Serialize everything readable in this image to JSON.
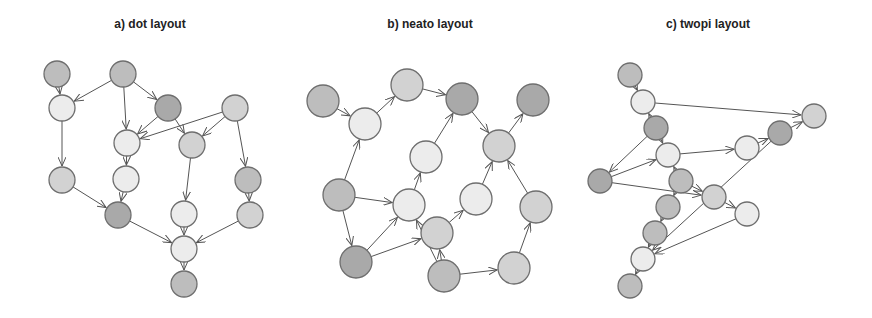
{
  "panels": [
    {
      "title": "a) dot layout",
      "title_x": 150,
      "radius": 13,
      "nodes": [
        {
          "id": "a1",
          "x": 57,
          "y": 74,
          "shade": "dark"
        },
        {
          "id": "a2",
          "x": 123,
          "y": 74,
          "shade": "dark"
        },
        {
          "id": "a3",
          "x": 62,
          "y": 108,
          "shade": "light"
        },
        {
          "id": "a4",
          "x": 168,
          "y": 108,
          "shade": "darker"
        },
        {
          "id": "a5",
          "x": 235,
          "y": 108,
          "shade": "mid"
        },
        {
          "id": "a6",
          "x": 127,
          "y": 143,
          "shade": "light"
        },
        {
          "id": "a7",
          "x": 192,
          "y": 145,
          "shade": "mid"
        },
        {
          "id": "a8",
          "x": 62,
          "y": 180,
          "shade": "mid"
        },
        {
          "id": "a9",
          "x": 126,
          "y": 179,
          "shade": "light"
        },
        {
          "id": "a10",
          "x": 248,
          "y": 180,
          "shade": "dark"
        },
        {
          "id": "a11",
          "x": 118,
          "y": 215,
          "shade": "darker"
        },
        {
          "id": "a12",
          "x": 184,
          "y": 214,
          "shade": "light"
        },
        {
          "id": "a13",
          "x": 250,
          "y": 215,
          "shade": "mid"
        },
        {
          "id": "a14",
          "x": 184,
          "y": 249,
          "shade": "light"
        },
        {
          "id": "a15",
          "x": 184,
          "y": 284,
          "shade": "dark"
        }
      ],
      "edges": [
        [
          "a1",
          "a3"
        ],
        [
          "a2",
          "a3"
        ],
        [
          "a2",
          "a6"
        ],
        [
          "a2",
          "a4"
        ],
        [
          "a4",
          "a6"
        ],
        [
          "a4",
          "a7"
        ],
        [
          "a5",
          "a6"
        ],
        [
          "a5",
          "a7"
        ],
        [
          "a5",
          "a10"
        ],
        [
          "a3",
          "a8"
        ],
        [
          "a6",
          "a9"
        ],
        [
          "a8",
          "a11"
        ],
        [
          "a9",
          "a11"
        ],
        [
          "a7",
          "a12"
        ],
        [
          "a10",
          "a13"
        ],
        [
          "a11",
          "a14"
        ],
        [
          "a12",
          "a14"
        ],
        [
          "a13",
          "a14"
        ],
        [
          "a14",
          "a15"
        ]
      ]
    },
    {
      "title": "b) neato layout",
      "title_x": 430,
      "radius": 16,
      "nodes": [
        {
          "id": "b1",
          "x": 323,
          "y": 101,
          "shade": "dark"
        },
        {
          "id": "b2",
          "x": 365,
          "y": 124,
          "shade": "light"
        },
        {
          "id": "b3",
          "x": 407,
          "y": 85,
          "shade": "mid"
        },
        {
          "id": "b4",
          "x": 462,
          "y": 99,
          "shade": "darker"
        },
        {
          "id": "b5",
          "x": 533,
          "y": 100,
          "shade": "darker"
        },
        {
          "id": "b6",
          "x": 426,
          "y": 157,
          "shade": "light"
        },
        {
          "id": "b7",
          "x": 499,
          "y": 146,
          "shade": "mid"
        },
        {
          "id": "b8",
          "x": 339,
          "y": 195,
          "shade": "dark"
        },
        {
          "id": "b9",
          "x": 409,
          "y": 205,
          "shade": "light"
        },
        {
          "id": "b10",
          "x": 476,
          "y": 199,
          "shade": "light"
        },
        {
          "id": "b11",
          "x": 536,
          "y": 207,
          "shade": "mid"
        },
        {
          "id": "b12",
          "x": 437,
          "y": 233,
          "shade": "mid"
        },
        {
          "id": "b13",
          "x": 356,
          "y": 262,
          "shade": "darker"
        },
        {
          "id": "b14",
          "x": 444,
          "y": 276,
          "shade": "dark"
        },
        {
          "id": "b15",
          "x": 514,
          "y": 268,
          "shade": "mid"
        }
      ],
      "edges": [
        [
          "b1",
          "b2"
        ],
        [
          "b2",
          "b3"
        ],
        [
          "b3",
          "b4"
        ],
        [
          "b4",
          "b7"
        ],
        [
          "b7",
          "b5"
        ],
        [
          "b8",
          "b2"
        ],
        [
          "b8",
          "b9"
        ],
        [
          "b8",
          "b13"
        ],
        [
          "b9",
          "b6"
        ],
        [
          "b6",
          "b4"
        ],
        [
          "b13",
          "b9"
        ],
        [
          "b13",
          "b12"
        ],
        [
          "b14",
          "b9"
        ],
        [
          "b14",
          "b12"
        ],
        [
          "b12",
          "b10"
        ],
        [
          "b10",
          "b7"
        ],
        [
          "b11",
          "b7"
        ],
        [
          "b15",
          "b11"
        ],
        [
          "b14",
          "b15"
        ]
      ]
    },
    {
      "title": "c) twopi layout",
      "title_x": 708,
      "radius": 12,
      "nodes": [
        {
          "id": "c1",
          "x": 630,
          "y": 75,
          "shade": "dark"
        },
        {
          "id": "c2",
          "x": 643,
          "y": 102,
          "shade": "light"
        },
        {
          "id": "c3",
          "x": 656,
          "y": 128,
          "shade": "darker"
        },
        {
          "id": "c4",
          "x": 668,
          "y": 155,
          "shade": "light"
        },
        {
          "id": "c5",
          "x": 600,
          "y": 181,
          "shade": "darker"
        },
        {
          "id": "c6",
          "x": 681,
          "y": 181,
          "shade": "dark"
        },
        {
          "id": "c7",
          "x": 714,
          "y": 197,
          "shade": "mid"
        },
        {
          "id": "c8",
          "x": 747,
          "y": 148,
          "shade": "light"
        },
        {
          "id": "c9",
          "x": 780,
          "y": 133,
          "shade": "darker"
        },
        {
          "id": "c10",
          "x": 814,
          "y": 116,
          "shade": "mid"
        },
        {
          "id": "c11",
          "x": 668,
          "y": 207,
          "shade": "dark"
        },
        {
          "id": "c12",
          "x": 655,
          "y": 233,
          "shade": "dark"
        },
        {
          "id": "c13",
          "x": 643,
          "y": 259,
          "shade": "light"
        },
        {
          "id": "c14",
          "x": 630,
          "y": 286,
          "shade": "dark"
        },
        {
          "id": "c15",
          "x": 747,
          "y": 214,
          "shade": "light"
        }
      ],
      "edges": [
        [
          "c1",
          "c2"
        ],
        [
          "c2",
          "c10"
        ],
        [
          "c3",
          "c2"
        ],
        [
          "c3",
          "c4"
        ],
        [
          "c3",
          "c5"
        ],
        [
          "c5",
          "c4"
        ],
        [
          "c5",
          "c7"
        ],
        [
          "c4",
          "c8"
        ],
        [
          "c8",
          "c9"
        ],
        [
          "c9",
          "c10"
        ],
        [
          "c6",
          "c4"
        ],
        [
          "c6",
          "c7"
        ],
        [
          "c6",
          "c11"
        ],
        [
          "c7",
          "c15"
        ],
        [
          "c11",
          "c12"
        ],
        [
          "c12",
          "c13"
        ],
        [
          "c9",
          "c13"
        ],
        [
          "c15",
          "c13"
        ],
        [
          "c13",
          "c14"
        ]
      ]
    }
  ],
  "colors": {
    "darker": "#a9a9a9",
    "dark": "#bdbdbd",
    "mid": "#d2d2d2",
    "light": "#ececec",
    "stroke": "#6e6e6e",
    "edge": "#555555"
  }
}
